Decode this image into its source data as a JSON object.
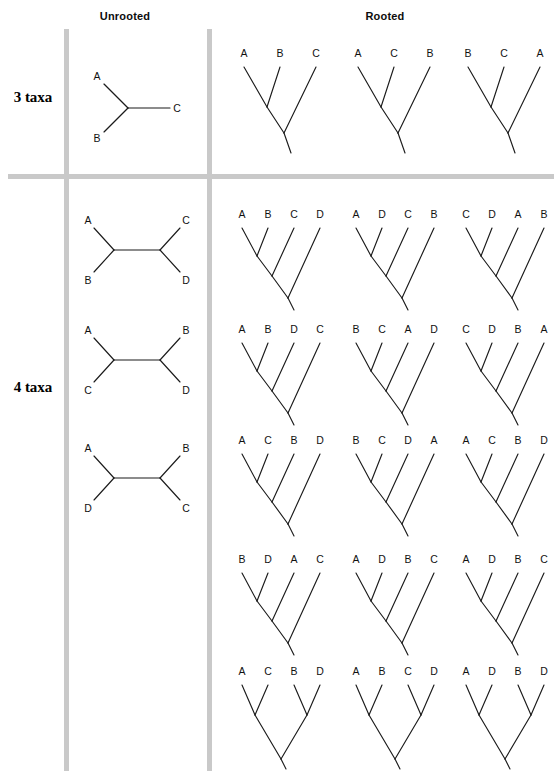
{
  "figure": {
    "headers": {
      "unrooted": "Unrooted",
      "rooted": "Rooted"
    },
    "row_labels": {
      "three_taxa": "3 taxa",
      "four_taxa": "4 taxa"
    },
    "colors": {
      "line": "#1b1b1b",
      "rule": "#c9c9c9",
      "text": "#111111",
      "background": "#ffffff"
    }
  },
  "chart_data": {
    "type": "diagram",
    "rows": [
      {
        "id": "three-taxa",
        "label": "3 taxa",
        "unrooted_count": 1,
        "rooted_count": 3,
        "unrooted": [
          {
            "id": "unrooted-3-1",
            "style": "y-shape",
            "tips": [
              "A",
              "B",
              "C"
            ],
            "newick": "(A,B,C)"
          }
        ],
        "rooted": [
          {
            "id": "rooted-3-1",
            "style": "ladder",
            "tips": [
              "A",
              "B",
              "C"
            ],
            "newick": "((A,B),C)"
          },
          {
            "id": "rooted-3-2",
            "style": "ladder",
            "tips": [
              "A",
              "C",
              "B"
            ],
            "newick": "((A,C),B)"
          },
          {
            "id": "rooted-3-3",
            "style": "ladder",
            "tips": [
              "B",
              "C",
              "A"
            ],
            "newick": "((B,C),A)"
          }
        ]
      },
      {
        "id": "four-taxa",
        "label": "4 taxa",
        "unrooted_count": 3,
        "rooted_count": 15,
        "unrooted": [
          {
            "id": "unrooted-4-1",
            "style": "h-shape",
            "tips": [
              "A",
              "B",
              "C",
              "D"
            ],
            "newick": "((A,B),(C,D))"
          },
          {
            "id": "unrooted-4-2",
            "style": "h-shape",
            "tips": [
              "A",
              "C",
              "B",
              "D"
            ],
            "newick": "((A,C),(B,D))"
          },
          {
            "id": "unrooted-4-3",
            "style": "h-shape",
            "tips": [
              "A",
              "D",
              "B",
              "C"
            ],
            "newick": "((A,D),(B,C))"
          }
        ],
        "rooted": [
          {
            "id": "rooted-4-1",
            "style": "ladder",
            "tips": [
              "A",
              "B",
              "C",
              "D"
            ],
            "newick": "(((A,B),C),D)"
          },
          {
            "id": "rooted-4-2",
            "style": "ladder",
            "tips": [
              "A",
              "D",
              "C",
              "B"
            ],
            "newick": "(((A,D),C),B)"
          },
          {
            "id": "rooted-4-3",
            "style": "ladder",
            "tips": [
              "C",
              "D",
              "A",
              "B"
            ],
            "newick": "(((C,D),A),B)"
          },
          {
            "id": "rooted-4-4",
            "style": "ladder",
            "tips": [
              "A",
              "B",
              "D",
              "C"
            ],
            "newick": "(((A,B),D),C)"
          },
          {
            "id": "rooted-4-5",
            "style": "ladder",
            "tips": [
              "B",
              "C",
              "A",
              "D"
            ],
            "newick": "(((B,C),A),D)"
          },
          {
            "id": "rooted-4-6",
            "style": "ladder",
            "tips": [
              "C",
              "D",
              "B",
              "A"
            ],
            "newick": "(((C,D),B),A)"
          },
          {
            "id": "rooted-4-7",
            "style": "ladder",
            "tips": [
              "A",
              "C",
              "B",
              "D"
            ],
            "newick": "(((A,C),B),D)"
          },
          {
            "id": "rooted-4-8",
            "style": "ladder",
            "tips": [
              "B",
              "C",
              "D",
              "A"
            ],
            "newick": "(((B,C),D),A)"
          },
          {
            "id": "rooted-4-9",
            "style": "ladder",
            "tips": [
              "A",
              "C",
              "B",
              "D"
            ],
            "newick": "(((A,C),B),D)"
          },
          {
            "id": "rooted-4-10",
            "style": "ladder",
            "tips": [
              "B",
              "D",
              "A",
              "C"
            ],
            "newick": "(((B,D),A),C)"
          },
          {
            "id": "rooted-4-11",
            "style": "ladder",
            "tips": [
              "A",
              "D",
              "B",
              "C"
            ],
            "newick": "(((A,D),B),C)"
          },
          {
            "id": "rooted-4-12",
            "style": "ladder",
            "tips": [
              "A",
              "D",
              "B",
              "C"
            ],
            "newick": "(((A,D),B),C)"
          },
          {
            "id": "rooted-4-13",
            "style": "balanced",
            "tips": [
              "A",
              "C",
              "B",
              "D"
            ],
            "newick": "((A,C),(B,D))"
          },
          {
            "id": "rooted-4-14",
            "style": "balanced",
            "tips": [
              "A",
              "B",
              "C",
              "D"
            ],
            "newick": "((A,B),(C,D))"
          },
          {
            "id": "rooted-4-15",
            "style": "balanced",
            "tips": [
              "A",
              "D",
              "B",
              "D"
            ],
            "newick": "((A,D),(B,D))"
          }
        ]
      }
    ],
    "layout": {
      "unrooted_column_x": 125,
      "rooted_column_x": [
        275,
        390,
        498
      ],
      "rooted_row_y": [
        48,
        210,
        325,
        440,
        555,
        668
      ],
      "divider_x": [
        66,
        209
      ],
      "divider_y": [
        177
      ]
    }
  },
  "tree_positions": {
    "unrooted": [
      {
        "data_path": "chart_data.rows.0.unrooted.0",
        "left": 80,
        "top": 66,
        "w": 100,
        "h": 80
      },
      {
        "data_path": "chart_data.rows.1.unrooted.0",
        "left": 80,
        "top": 212,
        "w": 100,
        "h": 72
      },
      {
        "data_path": "chart_data.rows.1.unrooted.1",
        "left": 80,
        "top": 322,
        "w": 100,
        "h": 72
      },
      {
        "data_path": "chart_data.rows.1.unrooted.2",
        "left": 80,
        "top": 440,
        "w": 100,
        "h": 72
      }
    ],
    "rooted": [
      {
        "data_path": "chart_data.rows.0.rooted.0",
        "left": 228,
        "top": 45,
        "w": 104,
        "h": 112
      },
      {
        "data_path": "chart_data.rows.0.rooted.1",
        "left": 342,
        "top": 45,
        "w": 104,
        "h": 112
      },
      {
        "data_path": "chart_data.rows.0.rooted.2",
        "left": 452,
        "top": 45,
        "w": 104,
        "h": 112
      },
      {
        "data_path": "chart_data.rows.1.rooted.0",
        "left": 228,
        "top": 206,
        "w": 104,
        "h": 100
      },
      {
        "data_path": "chart_data.rows.1.rooted.1",
        "left": 342,
        "top": 206,
        "w": 104,
        "h": 100
      },
      {
        "data_path": "chart_data.rows.1.rooted.2",
        "left": 452,
        "top": 206,
        "w": 104,
        "h": 100
      },
      {
        "data_path": "chart_data.rows.1.rooted.3",
        "left": 228,
        "top": 321,
        "w": 104,
        "h": 100
      },
      {
        "data_path": "chart_data.rows.1.rooted.4",
        "left": 342,
        "top": 321,
        "w": 104,
        "h": 100
      },
      {
        "data_path": "chart_data.rows.1.rooted.5",
        "left": 452,
        "top": 321,
        "w": 104,
        "h": 100
      },
      {
        "data_path": "chart_data.rows.1.rooted.6",
        "left": 228,
        "top": 432,
        "w": 104,
        "h": 100
      },
      {
        "data_path": "chart_data.rows.1.rooted.7",
        "left": 342,
        "top": 432,
        "w": 104,
        "h": 100
      },
      {
        "data_path": "chart_data.rows.1.rooted.8",
        "left": 452,
        "top": 432,
        "w": 104,
        "h": 100
      },
      {
        "data_path": "chart_data.rows.1.rooted.9",
        "left": 228,
        "top": 551,
        "w": 104,
        "h": 100
      },
      {
        "data_path": "chart_data.rows.1.rooted.10",
        "left": 342,
        "top": 551,
        "w": 104,
        "h": 100
      },
      {
        "data_path": "chart_data.rows.1.rooted.11",
        "left": 452,
        "top": 551,
        "w": 104,
        "h": 100
      },
      {
        "data_path": "chart_data.rows.1.rooted.12",
        "left": 228,
        "top": 663,
        "w": 104,
        "h": 100
      },
      {
        "data_path": "chart_data.rows.1.rooted.13",
        "left": 342,
        "top": 663,
        "w": 104,
        "h": 100
      },
      {
        "data_path": "chart_data.rows.1.rooted.14",
        "left": 452,
        "top": 663,
        "w": 104,
        "h": 100
      }
    ]
  }
}
